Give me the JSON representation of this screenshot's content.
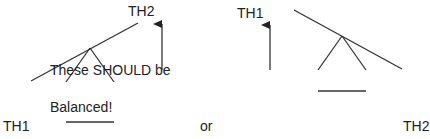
{
  "labels": {
    "left_th2": "TH2",
    "left_th1": "TH1",
    "caption_line1": "These SHOULD be",
    "caption_line2": "Balanced!",
    "connector": "or",
    "right_th1": "TH1",
    "right_th2": "TH2"
  },
  "colors": {
    "line": "#333333",
    "text": "#222222"
  }
}
